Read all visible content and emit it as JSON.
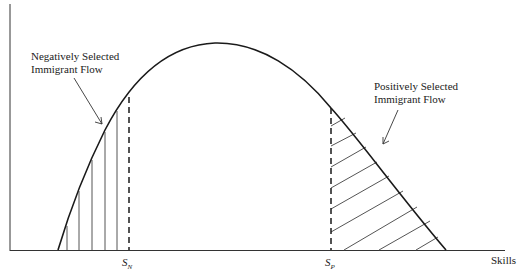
{
  "diagram": {
    "type": "skill-distribution",
    "x_axis_label": "Skills",
    "thresholds": [
      {
        "id": "SN",
        "symbol": "S",
        "subscript": "N"
      },
      {
        "id": "SP",
        "symbol": "S",
        "subscript": "P"
      }
    ],
    "annotations": {
      "negative": {
        "line1": "Negatively Selected",
        "line2": "Immigrant Flow"
      },
      "positive": {
        "line1": "Positively Selected",
        "line2": "Immigrant Flow"
      }
    },
    "colors": {
      "line": "#1a1a1a",
      "hatch": "#555555",
      "text": "#222222"
    }
  }
}
